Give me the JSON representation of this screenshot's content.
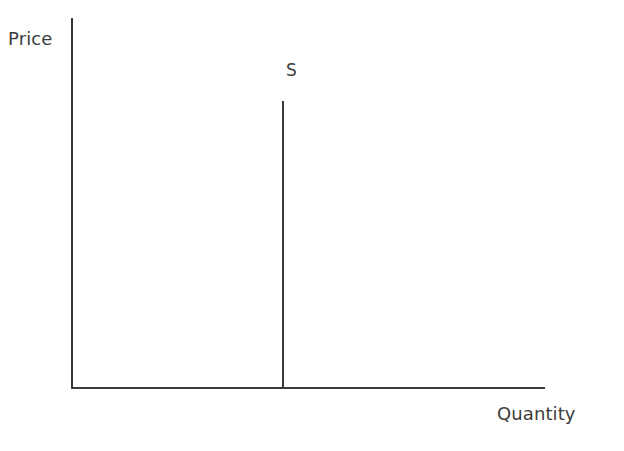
{
  "figure": {
    "width": 624,
    "height": 451,
    "background_color": "#ffffff",
    "line_color": "#3a3a3a",
    "text_color": "#3c3c3c"
  },
  "labels": {
    "y_axis": "Price",
    "x_axis": "Quantity",
    "supply_curve": "S"
  },
  "chart_data": {
    "type": "line",
    "title": "",
    "subtitle": "",
    "xlabel": "Quantity",
    "ylabel": "Price",
    "grid": false,
    "legend": null,
    "axis_ticks": {
      "x": [],
      "y": []
    },
    "xlim": [
      0,
      1
    ],
    "ylim": [
      0,
      1
    ],
    "annotations": [
      {
        "text": "S",
        "x": 0.445,
        "y": 0.88,
        "describes": "supply-curve"
      }
    ],
    "series": [
      {
        "name": "S",
        "label": "S",
        "description": "Perfectly inelastic supply: vertical line at a fixed quantity",
        "shape": "vertical",
        "color": "#3a3a3a",
        "x": [
          0.445,
          0.445
        ],
        "y": [
          0.0,
          0.774
        ],
        "points": [
          {
            "x": 0.445,
            "y": 0.0
          },
          {
            "x": 0.445,
            "y": 0.774
          }
        ]
      }
    ]
  }
}
